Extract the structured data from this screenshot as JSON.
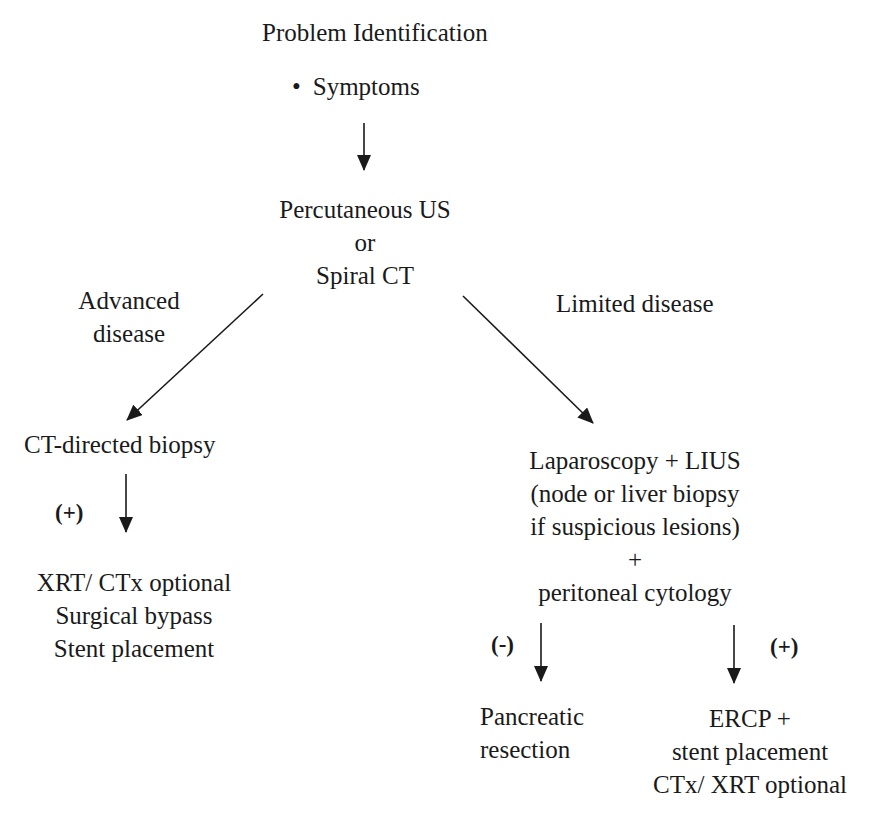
{
  "diagram": {
    "type": "flowchart",
    "nodes": {
      "problem": {
        "title": "Problem Identification",
        "bullet": "•",
        "item": "Symptoms"
      },
      "imaging": {
        "lines": [
          "Percutaneous US",
          "or",
          "Spiral CT"
        ]
      },
      "ct_biopsy": {
        "text": "CT-directed biopsy"
      },
      "advanced_treatment": {
        "lines": [
          "XRT/ CTx optional",
          "Surgical bypass",
          "Stent placement"
        ]
      },
      "laparoscopy": {
        "lines": [
          "Laparoscopy + LIUS",
          "(node or liver biopsy",
          "if suspicious lesions)",
          "+",
          "peritoneal cytology"
        ]
      },
      "resection": {
        "lines": [
          "Pancreatic",
          "resection"
        ]
      },
      "ercp": {
        "lines": [
          "ERCP +",
          "stent placement",
          "CTx/ XRT optional"
        ]
      }
    },
    "edge_labels": {
      "advanced": [
        "Advanced",
        "disease"
      ],
      "limited": "Limited disease",
      "biopsy_positive": "(+)",
      "cytology_negative": "(-)",
      "cytology_positive": "(+)"
    },
    "edges": [
      {
        "from": "problem",
        "to": "imaging"
      },
      {
        "from": "imaging",
        "to": "ct_biopsy",
        "label": "Advanced disease"
      },
      {
        "from": "imaging",
        "to": "laparoscopy",
        "label": "Limited disease"
      },
      {
        "from": "ct_biopsy",
        "to": "advanced_treatment",
        "label": "(+)"
      },
      {
        "from": "laparoscopy",
        "to": "resection",
        "label": "(-)"
      },
      {
        "from": "laparoscopy",
        "to": "ercp",
        "label": "(+)"
      }
    ]
  }
}
